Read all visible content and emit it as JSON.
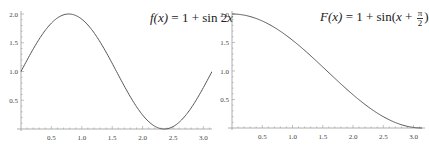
{
  "chart_data": [
    {
      "type": "line",
      "title": "f(x) = 1 + sin 2x",
      "formula": {
        "lhs": "f(x)",
        "eq": " = 1 + sin 2",
        "var": "x"
      },
      "function": "1 + sin(2x)",
      "x_range": [
        0,
        3.14159
      ],
      "ylim": [
        0,
        2.0
      ],
      "xticks": [
        "0.5",
        "1.0",
        "1.5",
        "2.0",
        "2.5",
        "3.0"
      ],
      "yticks": [
        "0.5",
        "1.0",
        "1.5",
        "2.0"
      ],
      "x": [
        0,
        0.25,
        0.5,
        0.785,
        1.0,
        1.25,
        1.5,
        1.75,
        2.0,
        2.356,
        2.5,
        2.75,
        3.0,
        3.14
      ],
      "values": [
        1.0,
        1.48,
        1.84,
        2.0,
        1.91,
        1.6,
        1.14,
        0.65,
        0.24,
        0.0,
        0.04,
        0.29,
        0.72,
        1.0
      ],
      "grid": false,
      "line_color": "#555555"
    },
    {
      "type": "line",
      "title": "F(x) = 1 + sin(x + π/2)",
      "formula": {
        "lhs": "F(x)",
        "eq": " = 1 + sin(",
        "var": "x",
        "plus": " + ",
        "num": "π",
        "den": "2",
        "close": ")"
      },
      "function": "1 + sin(x + π/2)",
      "x_range": [
        0,
        3.14159
      ],
      "ylim": [
        0,
        2.0
      ],
      "xticks": [
        "0.5",
        "1.0",
        "1.5",
        "2.0",
        "2.5",
        "3.0"
      ],
      "yticks": [
        "0.5",
        "1.0",
        "1.5",
        "2.0"
      ],
      "x": [
        0,
        0.5,
        1.0,
        1.5,
        1.571,
        2.0,
        2.5,
        3.0,
        3.14
      ],
      "values": [
        2.0,
        1.88,
        1.54,
        1.07,
        1.0,
        0.58,
        0.2,
        0.01,
        0.0
      ],
      "grid": false,
      "line_color": "#555555"
    }
  ]
}
